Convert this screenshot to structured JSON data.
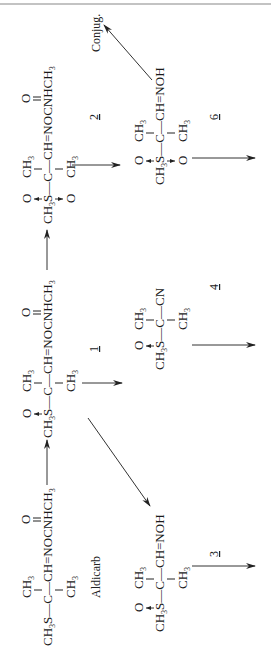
{
  "diagram": {
    "orientation": "rotated -90deg",
    "compounds": [
      {
        "id": "aldicarb",
        "name_label": "Aldicarb",
        "number": "",
        "top": "CH3",
        "main": "CH3S—C—CH=NOCNHCH3",
        "bottom": "CH3",
        "carbonyl": "O",
        "main_parts": {
          "s": "CH3S",
          "c": "C",
          "ch": "CH=NOCNHCH3"
        }
      },
      {
        "id": "c1",
        "number": "1",
        "s_oxide": "O",
        "top": "CH3",
        "main": "CH3S—C—CH=NOCNHCH3",
        "bottom": "CH3",
        "carbonyl": "O"
      },
      {
        "id": "c2",
        "number": "2",
        "s_oxide_top": "O",
        "s_oxide_bottom": "O",
        "top": "CH3",
        "main": "CH3S—C—CH=NOCNHCH3",
        "bottom": "CH3",
        "carbonyl": "O"
      },
      {
        "id": "c3",
        "number": "3",
        "s_oxide": "O",
        "top": "CH3",
        "main": "CH3S—C—CH=NOH",
        "bottom": "CH3"
      },
      {
        "id": "c4",
        "number": "4",
        "s_oxide": "O",
        "top": "CH3",
        "main": "CH3S—C—CN",
        "bottom": "CH3"
      },
      {
        "id": "c6",
        "number": "6",
        "s_oxide_top": "O",
        "s_oxide_bottom": "O",
        "top": "CH3",
        "main": "CH3S—C—CH=NOH",
        "bottom": "CH3"
      }
    ],
    "labels": {
      "aldicarb": "Aldicarb",
      "conjug": "Conjug.",
      "n1": "1",
      "n2": "2",
      "n3": "3",
      "n4": "4",
      "n6": "6"
    },
    "text": {
      "ch3": "CH",
      "three": "3",
      "ch3s": "CH",
      "s": "S",
      "c": "C",
      "o": "O",
      "ch_nocnhch": "CH=NOCNHCH",
      "ch_noh": "CH=NOH",
      "cn": "CN",
      "dash": "—"
    },
    "arrows": [
      {
        "from": "aldicarb",
        "to": "c1"
      },
      {
        "from": "c1",
        "to": "c2"
      },
      {
        "from": "aldicarb",
        "to": "c3"
      },
      {
        "from": "c1",
        "to": "c4"
      },
      {
        "from": "c2",
        "to": "c6"
      },
      {
        "from": "c6",
        "to": "conjug"
      },
      {
        "from": "c3",
        "to": "further"
      },
      {
        "from": "c4",
        "to": "further"
      },
      {
        "from": "c6",
        "to": "further"
      }
    ]
  }
}
